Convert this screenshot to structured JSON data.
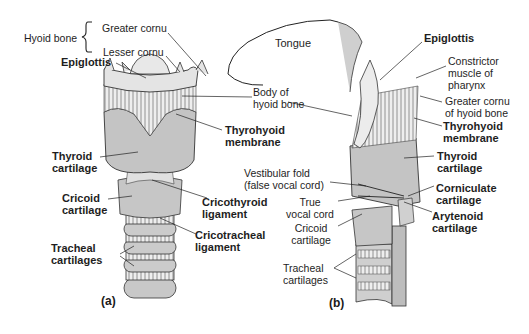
{
  "figure": {
    "panel_a_label": "(a)",
    "panel_b_label": "(b)"
  },
  "labels_a": {
    "hyoid_bone": "Hyoid bone",
    "greater_cornu": "Greater cornu",
    "lesser_cornu": "Lesser cornu",
    "epiglottis": "Epiglottis",
    "thyroid_1": "Thyroid",
    "thyroid_2": "cartilage",
    "cricoid_1": "Cricoid",
    "cricoid_2": "cartilage",
    "tracheal_1": "Tracheal",
    "tracheal_2": "cartilages"
  },
  "labels_center": {
    "tongue": "Tongue",
    "body_hyoid_1": "Body of",
    "body_hyoid_2": "hyoid bone",
    "thyrohyoid_1": "Thyrohyoid",
    "thyrohyoid_2": "membrane",
    "vestibular_1": "Vestibular fold",
    "vestibular_2": "(false vocal cord)",
    "cricothyroid_1": "Cricothyroid",
    "cricothyroid_2": "ligament",
    "true_vocal_1": "True",
    "true_vocal_2": "vocal cord",
    "cricotracheal_1": "Cricotracheal",
    "cricotracheal_2": "ligament",
    "cricoid_b_1": "Cricoid",
    "cricoid_b_2": "cartilage",
    "tracheal_b_1": "Tracheal",
    "tracheal_b_2": "cartilages"
  },
  "labels_b": {
    "epiglottis": "Epiglottis",
    "constrictor_1": "Constrictor",
    "constrictor_2": "muscle of",
    "constrictor_3": "pharynx",
    "greater_cornu_1": "Greater cornu",
    "greater_cornu_2": "of hyoid bone",
    "thyrohyoid_1": "Thyrohyoid",
    "thyrohyoid_2": "membrane",
    "thyroid_1": "Thyroid",
    "thyroid_2": "cartilage",
    "corniculate_1": "Corniculate",
    "corniculate_2": "cartilage",
    "arytenoid_1": "Arytenoid",
    "arytenoid_2": "cartilage"
  },
  "colors": {
    "cartilage": "#c9c9c9",
    "membrane": "#e6e6e6",
    "line": "#222222",
    "background": "#ffffff"
  }
}
